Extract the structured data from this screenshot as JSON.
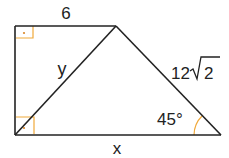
{
  "diagram": {
    "type": "trapezoid-geometry",
    "labels": {
      "top": "6",
      "diagonal": "y",
      "right_side": "12",
      "right_side_radical": "2",
      "angle": "45°",
      "bottom": "x"
    },
    "colors": {
      "stroke": "#222222",
      "right_angle_marker": "#f0a93a"
    }
  }
}
